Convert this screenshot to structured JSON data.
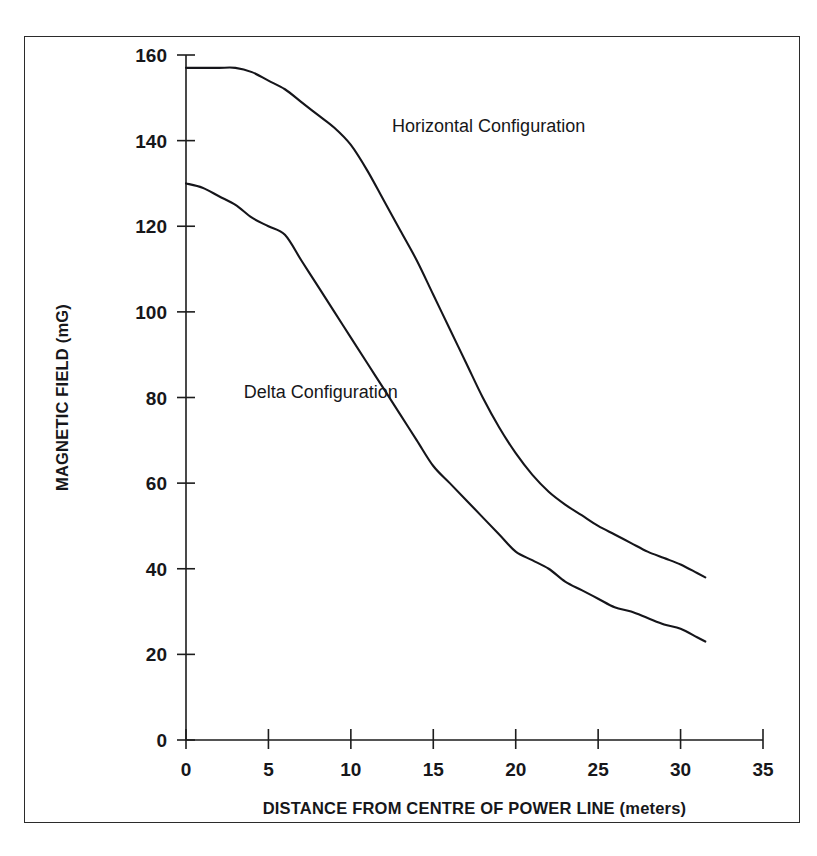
{
  "figure": {
    "background_color": "#ffffff",
    "frame_color": "#2b2b2b",
    "ink_color": "#15151a"
  },
  "chart_data": {
    "type": "line",
    "title": "",
    "subtitle": "",
    "xlabel": "DISTANCE FROM CENTRE OF POWER LINE (meters)",
    "ylabel": "MAGNETIC FIELD (mG)",
    "xlim": [
      0,
      35
    ],
    "ylim": [
      0,
      160
    ],
    "xticks": [
      0,
      5,
      10,
      15,
      20,
      25,
      30,
      35
    ],
    "yticks": [
      0,
      20,
      40,
      60,
      80,
      100,
      120,
      140,
      160
    ],
    "xtick_labels": [
      "0",
      "5",
      "10",
      "15",
      "20",
      "25",
      "30",
      "35"
    ],
    "ytick_labels": [
      "0",
      "20",
      "40",
      "60",
      "80",
      "100",
      "120",
      "140",
      "160"
    ],
    "grid": false,
    "legend_position": "inline-annotations",
    "series": [
      {
        "name": "Horizontal Configuration",
        "label_x": 12.5,
        "label_y": 142,
        "color": "#15151a",
        "x": [
          0,
          1,
          2,
          3,
          4,
          5,
          6,
          7,
          8,
          9,
          10,
          11,
          12,
          13,
          14,
          15,
          16,
          17,
          18,
          19,
          20,
          21,
          22,
          23,
          24,
          25,
          26,
          27,
          28,
          29,
          30,
          31,
          31.5
        ],
        "y": [
          157,
          157,
          157,
          157,
          156,
          154,
          152,
          149,
          146,
          143,
          139,
          133,
          126,
          119,
          112,
          104,
          96,
          88,
          80,
          73,
          67,
          62,
          58,
          55,
          52.5,
          50,
          48,
          46,
          44,
          42.5,
          41,
          39,
          38
        ]
      },
      {
        "name": "Delta Configuration",
        "label_x": 3.5,
        "label_y": 80,
        "color": "#15151a",
        "x": [
          0,
          1,
          2,
          3,
          4,
          5,
          6,
          7,
          8,
          9,
          10,
          11,
          12,
          13,
          14,
          15,
          16,
          17,
          18,
          19,
          20,
          21,
          22,
          23,
          24,
          25,
          26,
          27,
          28,
          29,
          30,
          31,
          31.5
        ],
        "y": [
          130,
          129,
          127,
          125,
          122,
          120,
          118,
          112,
          106,
          100,
          94,
          88,
          82,
          76,
          70,
          64,
          60,
          56,
          52,
          48,
          44,
          42,
          40,
          37,
          35,
          33,
          31,
          30,
          28.5,
          27,
          26,
          24,
          23
        ]
      }
    ],
    "annotations": [
      {
        "text": "Horizontal Configuration",
        "x": 12.5,
        "y": 142
      },
      {
        "text": "Delta Configuration",
        "x": 3.5,
        "y": 80
      }
    ]
  }
}
